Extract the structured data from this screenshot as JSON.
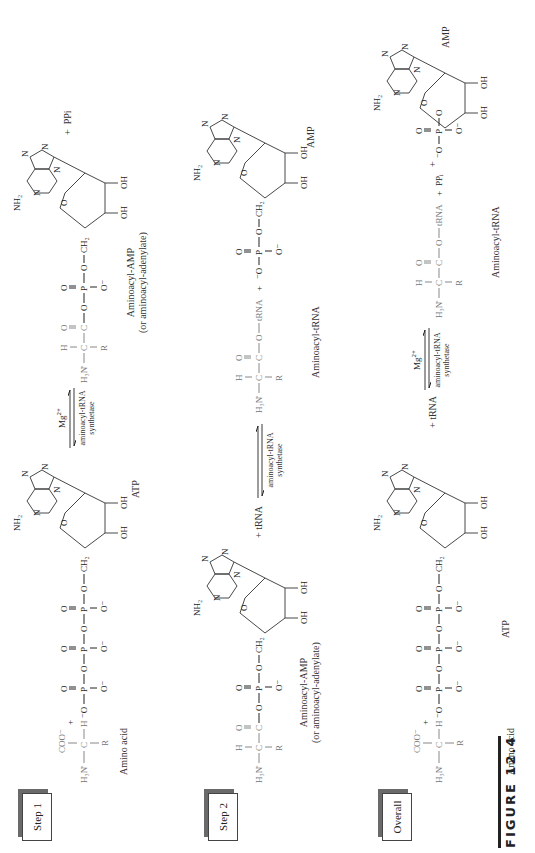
{
  "figure": {
    "label": "FIGURE 12.4",
    "orientation": "rotated 90° counterclockwise"
  },
  "steps": [
    {
      "label": "Step 1",
      "reactants": [
        "Amino acid",
        "ATP"
      ],
      "arrow": {
        "top": "Mg2+",
        "bottom_line1": "aminoacyl-tRNA",
        "bottom_line2": "synthetase"
      },
      "products": [
        "Aminoacyl-AMP",
        "PPi"
      ],
      "product_caption_line1": "Aminoacyl-AMP",
      "product_caption_line2": "(or aminoacyl-adenylate)"
    },
    {
      "label": "Step 2",
      "reactants": [
        "Aminoacyl-AMP",
        "tRNA"
      ],
      "reactant_caption_line1": "Aminoacyl-AMP",
      "reactant_caption_line2": "(or aminoacyl-adenylate)",
      "plus_trna": "+ tRNA",
      "arrow": {
        "top": "",
        "bottom_line1": "aminoacyl-tRNA",
        "bottom_line2": "synthetase"
      },
      "products": [
        "Aminoacyl-tRNA",
        "AMP"
      ]
    },
    {
      "label": "Overall",
      "reactants": [
        "Amino acid",
        "ATP",
        "tRNA"
      ],
      "plus_trna": "+ tRNA",
      "arrow": {
        "top": "Mg2+",
        "bottom_line1": "aminoacyl-tRNA",
        "bottom_line2": "synthetase"
      },
      "products": [
        "Aminoacyl-tRNA",
        "PPi",
        "AMP"
      ]
    }
  ],
  "captions": {
    "amino_acid": "Amino acid",
    "atp": "ATP",
    "amp": "AMP",
    "aminoacyl_trna": "Aminoacyl-tRNA",
    "ppi": "PPi",
    "plus": "+"
  },
  "atoms": {
    "nh2": "NH2",
    "n": "N",
    "o": "O",
    "oh": "OH",
    "ch2": "CH2",
    "p": "P",
    "h3n": "H3N",
    "c": "C",
    "h": "H",
    "r": "R",
    "coo": "COO−",
    "o_minus": "O−",
    "minus_o": "−O",
    "trna": "tRNA"
  },
  "colors": {
    "amino_acid_gray": "#777777",
    "ink": "#222222",
    "box_shadow": "#6a6a6a"
  }
}
